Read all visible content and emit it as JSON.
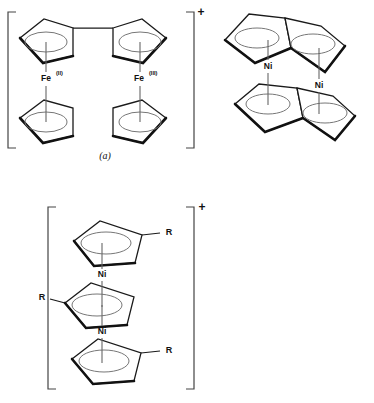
{
  "figure": {
    "background_color": "#ffffff",
    "line_color": "#1a1a1a",
    "panels": [
      {
        "id": "a",
        "caption": "(a)",
        "charge": "+",
        "bracketed": true,
        "type": "bridged-biferrocene-cation",
        "metals": [
          {
            "element": "Fe",
            "oxidation_state": "(II)"
          },
          {
            "element": "Fe",
            "oxidation_state": "(III)"
          }
        ],
        "ring_count": 4,
        "ring_type": "cyclopentadienyl"
      },
      {
        "id": "b",
        "caption": "(b)",
        "charge": "",
        "bracketed": false,
        "type": "bimetallic-nickel-pentalene-complex",
        "metals": [
          {
            "element": "Ni",
            "oxidation_state": ""
          },
          {
            "element": "Ni",
            "oxidation_state": ""
          }
        ],
        "ring_count": 4,
        "ring_type": "fused-cyclopentadienyl"
      },
      {
        "id": "c",
        "caption": "",
        "charge": "+",
        "bracketed": true,
        "type": "triple-decker-nickel-sandwich-cation",
        "metals": [
          {
            "element": "Ni",
            "oxidation_state": ""
          },
          {
            "element": "Ni",
            "oxidation_state": ""
          }
        ],
        "ring_count": 3,
        "ring_type": "substituted-cyclopentadienyl",
        "substituents": [
          {
            "label": "R",
            "position": "top-right"
          },
          {
            "label": "R",
            "position": "middle-left"
          },
          {
            "label": "R",
            "position": "bottom-right"
          }
        ]
      }
    ],
    "labels": {
      "fe_symbol": "Fe",
      "fe_two_sup": "(II)",
      "fe_three_sup": "(III)",
      "ni_symbol": "Ni",
      "r_group": "R",
      "plus_charge": "+",
      "caption_a": "(a)",
      "caption_b": "(b)"
    }
  }
}
